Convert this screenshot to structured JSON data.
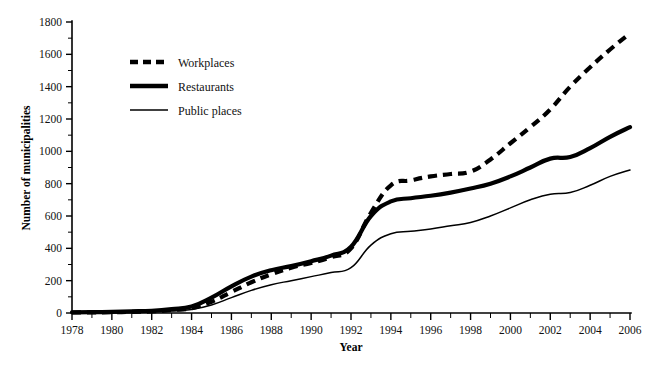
{
  "chart_data": {
    "type": "line",
    "title": "",
    "xlabel": "Year",
    "ylabel": "Number of municipalities",
    "xlim": [
      1978,
      2006
    ],
    "ylim": [
      0,
      1800
    ],
    "grid": false,
    "legend_position": "upper-left",
    "x": [
      1978,
      1979,
      1980,
      1981,
      1982,
      1983,
      1984,
      1985,
      1986,
      1987,
      1988,
      1989,
      1990,
      1991,
      1992,
      1993,
      1994,
      1995,
      1996,
      1997,
      1998,
      1999,
      2000,
      2001,
      2002,
      2003,
      2004,
      2005,
      2006
    ],
    "x_tick_labels": [
      "1978",
      "1980",
      "1982",
      "1984",
      "1986",
      "1988",
      "1990",
      "1992",
      "1994",
      "1996",
      "1998",
      "2000",
      "2002",
      "2004",
      "2006"
    ],
    "x_tick_values": [
      1978,
      1980,
      1982,
      1984,
      1986,
      1988,
      1990,
      1992,
      1994,
      1996,
      1998,
      2000,
      2002,
      2004,
      2006
    ],
    "x_minor_interval": 1,
    "y_tick_labels": [
      "0",
      "200",
      "400",
      "600",
      "800",
      "1000",
      "1200",
      "1400",
      "1600",
      "1800"
    ],
    "y_tick_values": [
      0,
      200,
      400,
      600,
      800,
      1000,
      1200,
      1400,
      1600,
      1800
    ],
    "y_minor_interval": 100,
    "series": [
      {
        "name": "Workplaces",
        "style": "thick-dashed",
        "color": "#000000",
        "values": [
          3,
          4,
          5,
          7,
          10,
          18,
          30,
          70,
          130,
          190,
          240,
          280,
          310,
          345,
          400,
          620,
          790,
          820,
          845,
          860,
          875,
          950,
          1050,
          1150,
          1260,
          1400,
          1520,
          1630,
          1730
        ]
      },
      {
        "name": "Restaurants",
        "style": "thick-solid",
        "color": "#000000",
        "values": [
          4,
          5,
          7,
          10,
          14,
          24,
          40,
          95,
          165,
          225,
          265,
          290,
          320,
          355,
          410,
          600,
          690,
          710,
          725,
          745,
          770,
          800,
          845,
          900,
          955,
          965,
          1020,
          1090,
          1150
        ]
      },
      {
        "name": "Public places",
        "style": "thin-solid",
        "color": "#000000",
        "values": [
          2,
          3,
          4,
          5,
          7,
          12,
          22,
          50,
          95,
          140,
          175,
          200,
          225,
          250,
          280,
          420,
          490,
          505,
          520,
          540,
          560,
          600,
          650,
          700,
          735,
          745,
          790,
          845,
          885
        ]
      }
    ]
  },
  "legend": {
    "items": [
      {
        "label": "Workplaces",
        "style": "thick-dashed"
      },
      {
        "label": "Restaurants",
        "style": "thick-solid"
      },
      {
        "label": "Public places",
        "style": "thin-solid"
      }
    ]
  },
  "axes": {
    "x_title": "Year",
    "y_title": "Number of municipalities"
  }
}
